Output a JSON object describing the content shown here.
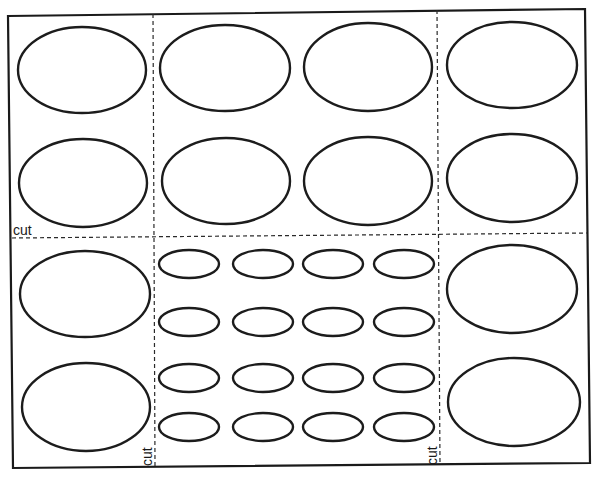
{
  "sheet": {
    "border_color": "#1a1a1a",
    "corners": {
      "top_left": [
        8,
        16
      ],
      "top_right": [
        585,
        9
      ],
      "bottom_right": [
        590,
        463
      ],
      "bottom_left": [
        13,
        468
      ]
    }
  },
  "cut_lines": {
    "horizontal": {
      "from": [
        12,
        238
      ],
      "to": [
        587,
        233
      ]
    },
    "vertical_left": {
      "from": [
        153,
        14
      ],
      "to": [
        155,
        466
      ]
    },
    "vertical_right": {
      "from": [
        437,
        10
      ],
      "to": [
        440,
        464
      ]
    }
  },
  "labels": {
    "horizontal_cut": "cut",
    "left_vertical_cut": "cut",
    "right_vertical_cut": "cut"
  },
  "large_ovals": [
    {
      "cx": 82,
      "cy": 70,
      "rx": 64,
      "ry": 43
    },
    {
      "cx": 225,
      "cy": 68,
      "rx": 65,
      "ry": 43
    },
    {
      "cx": 368,
      "cy": 67,
      "rx": 64,
      "ry": 44
    },
    {
      "cx": 512,
      "cy": 65,
      "rx": 65,
      "ry": 43
    },
    {
      "cx": 83,
      "cy": 183,
      "rx": 64,
      "ry": 44
    },
    {
      "cx": 226,
      "cy": 181,
      "rx": 64,
      "ry": 43
    },
    {
      "cx": 368,
      "cy": 181,
      "rx": 64,
      "ry": 44
    },
    {
      "cx": 512,
      "cy": 178,
      "rx": 65,
      "ry": 44
    },
    {
      "cx": 85,
      "cy": 294,
      "rx": 65,
      "ry": 43
    },
    {
      "cx": 86,
      "cy": 407,
      "rx": 64,
      "ry": 44
    },
    {
      "cx": 512,
      "cy": 289,
      "rx": 65,
      "ry": 44
    },
    {
      "cx": 514,
      "cy": 402,
      "rx": 66,
      "ry": 44
    }
  ],
  "small_ovals": {
    "columns_x": [
      189,
      263,
      333,
      404
    ],
    "rows_y": [
      264,
      322,
      378,
      427
    ],
    "rx": 30,
    "ry": 14
  }
}
